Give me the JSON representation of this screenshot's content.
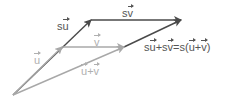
{
  "diagram": {
    "colors": {
      "dark": "#4a4a4a",
      "light": "#a8a8a8",
      "label_dark": "#555555",
      "label_light": "#b0b0b0"
    },
    "vectors": [
      {
        "id": "u",
        "from": [
          13,
          95
        ],
        "to": [
          62,
          47
        ],
        "shade": "light"
      },
      {
        "id": "v",
        "from": [
          62,
          47
        ],
        "to": [
          124,
          47
        ],
        "shade": "light"
      },
      {
        "id": "u_plus_v",
        "from": [
          13,
          95
        ],
        "to": [
          124,
          47
        ],
        "shade": "light"
      },
      {
        "id": "su",
        "from": [
          13,
          95
        ],
        "to": [
          91,
          20
        ],
        "shade": "dark"
      },
      {
        "id": "sv",
        "from": [
          91,
          20
        ],
        "to": [
          181,
          20
        ],
        "shade": "dark"
      },
      {
        "id": "su_plus_sv",
        "from": [
          124,
          47
        ],
        "to": [
          181,
          20
        ],
        "shade": "dark"
      }
    ],
    "labels": {
      "u": {
        "scalar": "",
        "vec": "u"
      },
      "v": {
        "scalar": "",
        "vec": "v"
      },
      "u_plus_v": {
        "a": "u",
        "plus": "+",
        "b": "v"
      },
      "su": {
        "scalar": "s",
        "vec": "u"
      },
      "sv": {
        "scalar": "s",
        "vec": "v"
      },
      "identity": {
        "s1": "s",
        "u1": "u",
        "plus1": "+",
        "s2": "s",
        "v1": "v",
        "eq": "=s(",
        "u2": "u",
        "plus2": "+",
        "v2": "v",
        "close": ")"
      }
    }
  }
}
